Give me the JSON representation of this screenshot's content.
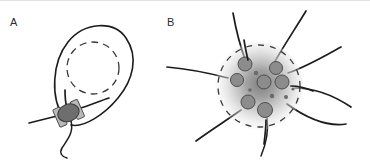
{
  "figure": {
    "width": 370,
    "height": 164,
    "background": "#ffffff",
    "caption_present": false,
    "panels": [
      {
        "id": "A",
        "label": "A",
        "label_x": 10,
        "label_y": 26,
        "description": "Teardrop-shaped cell body with dashed internal ring and a clamped junction at its narrow base",
        "parts": {
          "outline_name": "cell-outline",
          "dashed_ring_name": "nucleus-dashed-ring",
          "junction_name": "clamp-junction",
          "tail_name": "basal-tail"
        }
      },
      {
        "id": "B",
        "label": "B",
        "label_x": 167,
        "label_y": 26,
        "description": "Stellate cell with radial gradient cytoplasm, dashed boundary, gray granules and eight radiating processes",
        "parts": {
          "body_name": "cell-body-gradient",
          "dashed_boundary_name": "cell-dashed-boundary",
          "granules_name": "cytoplasmic-granules",
          "processes_name": "radiating-processes"
        }
      }
    ]
  },
  "colors": {
    "outline": "#1c1c1c",
    "dashed": "#3a3a3a",
    "clamp_core": "#6e6e6e",
    "clamp_block": "#b9b9b9",
    "granule_fill": "#8c8c8c",
    "granule_stroke": "#4e4e4e",
    "cytoplasm_center": "#8e8e8e",
    "cytoplasm_edge": "#ffffff",
    "label_text": "#2b2b2b",
    "background": "#ffffff"
  },
  "geometry": {
    "panel_a": {
      "loop_path": "M 62 116 C 52 96 56 60 70 42 C 84 24 112 22 124 38 C 136 54 132 78 118 96 C 106 112 86 126 72 124",
      "dashed_ring": {
        "cx": 93,
        "cy": 68,
        "r": 26
      },
      "clamp": {
        "cx": 68,
        "cy": 113,
        "rx": 11,
        "ry": 8,
        "rotation": -22
      },
      "left_whisker": "M 30 122 C 42 119 54 116 62 114",
      "up_whisker": "M 66 92 C 66 100 67 106 68 110",
      "right_whisker": "M 76 110 C 88 106 98 102 106 99",
      "basal_tail": "M 70 120 C 72 132 66 140 62 148 C 60 152 62 156 66 158"
    },
    "panel_b": {
      "body": {
        "cx": 259,
        "cy": 86,
        "r": 42
      },
      "gradient_center": {
        "cx": 259,
        "cy": 86,
        "r": 44
      },
      "dashed_boundary": {
        "cx": 259,
        "cy": 86,
        "r": 41
      },
      "granules": [
        {
          "cx": 245,
          "cy": 64,
          "r": 7.0
        },
        {
          "cx": 276,
          "cy": 68,
          "r": 6.5
        },
        {
          "cx": 237,
          "cy": 80,
          "r": 6.5
        },
        {
          "cx": 264,
          "cy": 82,
          "r": 7.0
        },
        {
          "cx": 282,
          "cy": 82,
          "r": 7.0
        },
        {
          "cx": 248,
          "cy": 102,
          "r": 7.0
        },
        {
          "cx": 265,
          "cy": 110,
          "r": 7.5
        }
      ],
      "micro_dots": [
        {
          "cx": 256,
          "cy": 73,
          "r": 2.2
        },
        {
          "cx": 272,
          "cy": 96,
          "r": 2.2
        },
        {
          "cx": 286,
          "cy": 97,
          "r": 2.0
        },
        {
          "cx": 250,
          "cy": 90,
          "r": 1.8
        },
        {
          "cx": 293,
          "cy": 89,
          "r": 1.6
        }
      ],
      "processes": [
        "M 246 62 C 240 46 236 30 233 14",
        "M 274 64 C 283 48 295 30 305 12",
        "M 288 74 C 305 68 322 58 340 48",
        "M 294 88 C 312 88 332 94 350 106",
        "M 288 104 C 305 116 325 126 345 124",
        "M 266 118 C 268 132 266 144 262 156",
        "M 240 110 C 226 120 210 130 196 140",
        "M 228 78 C 210 74 190 70 168 68"
      ],
      "process_count": 8
    }
  },
  "annotations": {
    "panel_a_label": "A",
    "panel_b_label": "B"
  }
}
